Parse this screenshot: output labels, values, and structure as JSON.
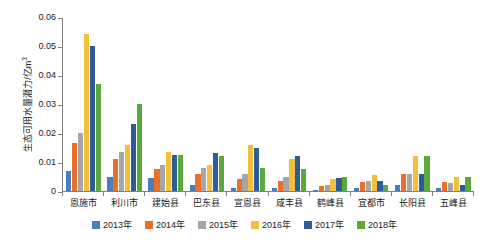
{
  "chart_data": {
    "type": "bar",
    "title": "",
    "subtitle": "",
    "xlabel": "",
    "ylabel": "生态可用水量潜力/亿m³",
    "ylabel_main": "生态可用水量潜力/亿m",
    "ylabel_sup": "3",
    "ylim": [
      0,
      0.06
    ],
    "ytick_values": [
      0,
      0.01,
      0.02,
      0.03,
      0.04,
      0.05,
      0.06
    ],
    "ytick_labels": [
      "0",
      "0.01",
      "0.02",
      "0.03",
      "0.04",
      "0.05",
      "0.06"
    ],
    "grid": false,
    "legend_position": "bottom",
    "categories": [
      "恩施市",
      "利川市",
      "建始县",
      "巴东县",
      "宣恩县",
      "咸丰县",
      "鹤峰县",
      "宜都市",
      "长阳县",
      "五峰县"
    ],
    "series": [
      {
        "name": "2013年",
        "color": "#4A7EBB",
        "values": [
          0.007,
          0.005,
          0.0045,
          0.002,
          0.001,
          0.0012,
          0.0005,
          0.0012,
          0.002,
          0.001
        ]
      },
      {
        "name": "2014年",
        "color": "#E8702A",
        "values": [
          0.0165,
          0.011,
          0.0075,
          0.006,
          0.004,
          0.0035,
          0.0018,
          0.003,
          0.006,
          0.003
        ]
      },
      {
        "name": "2015年",
        "color": "#A6A6A6",
        "values": [
          0.02,
          0.0135,
          0.009,
          0.008,
          0.006,
          0.005,
          0.002,
          0.0035,
          0.006,
          0.0028
        ]
      },
      {
        "name": "2016年",
        "color": "#F2BE3C",
        "values": [
          0.054,
          0.016,
          0.0135,
          0.009,
          0.016,
          0.011,
          0.004,
          0.0055,
          0.012,
          0.005
        ]
      },
      {
        "name": "2017年",
        "color": "#2E5C99",
        "values": [
          0.05,
          0.023,
          0.0125,
          0.013,
          0.015,
          0.012,
          0.0045,
          0.0035,
          0.006,
          0.002
        ]
      },
      {
        "name": "2018年",
        "color": "#5BA83B",
        "values": [
          0.037,
          0.03,
          0.0125,
          0.012,
          0.008,
          0.0075,
          0.005,
          0.002,
          0.012,
          0.005
        ]
      }
    ]
  }
}
